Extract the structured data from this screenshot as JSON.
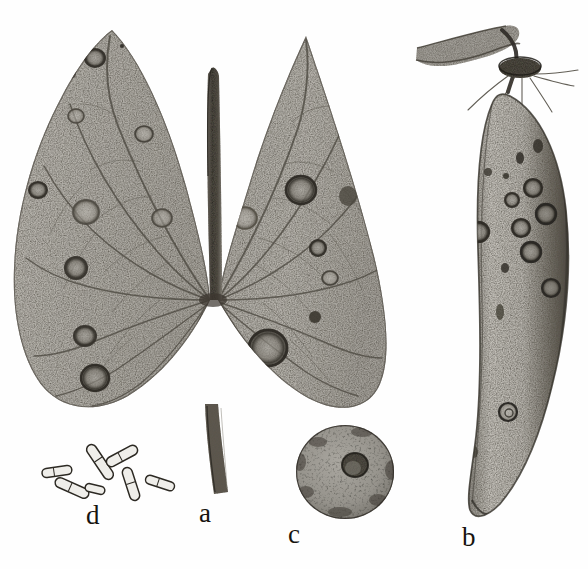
{
  "plate": {
    "background_color": "#fefefe",
    "ink_color": "#16140f",
    "medium": "stippled pen-and-ink scientific illustration",
    "subject": "anthracnose disease symptoms on leaf, pod and seed with conidia",
    "width": 588,
    "height": 569
  },
  "labels": [
    {
      "id": "a",
      "text": "a",
      "x": 199,
      "y": 500,
      "refers_to": "diseased leaf with petiole"
    },
    {
      "id": "b",
      "text": "b",
      "x": 462,
      "y": 524,
      "refers_to": "diseased pod with peduncle"
    },
    {
      "id": "c",
      "text": "c",
      "x": 288,
      "y": 521,
      "refers_to": "infected seed showing hilum"
    },
    {
      "id": "d",
      "text": "d",
      "x": 86,
      "y": 502,
      "refers_to": "conidia / spores"
    }
  ],
  "figures": {
    "leaf": {
      "name": "a",
      "description": "Bilobed arrowhead leaf, stippled grey lamina, dark midrib running vertically through the sinus, radiating palmate veins from the basal node, petiole descending below",
      "bounds": {
        "x": 8,
        "y": 28,
        "width": 378,
        "height": 470
      },
      "tone": "#b3b0aa",
      "lesion_count": 21,
      "lesions": [
        {
          "cx": 95,
          "cy": 58,
          "rx": 11,
          "ry": 10,
          "tone": "dark-ring"
        },
        {
          "cx": 70,
          "cy": 74,
          "rx": 6,
          "ry": 5,
          "tone": "dark-spot"
        },
        {
          "cx": 122,
          "cy": 46,
          "rx": 2,
          "ry": 2,
          "tone": "fleck"
        },
        {
          "cx": 76,
          "cy": 116,
          "rx": 9,
          "ry": 8,
          "tone": "pale-ring"
        },
        {
          "cx": 144,
          "cy": 134,
          "rx": 10,
          "ry": 9,
          "tone": "pale-ring"
        },
        {
          "cx": 38,
          "cy": 190,
          "rx": 10,
          "ry": 9,
          "tone": "dark-ring"
        },
        {
          "cx": 86,
          "cy": 212,
          "rx": 14,
          "ry": 13,
          "tone": "pale-ring"
        },
        {
          "cx": 76,
          "cy": 268,
          "rx": 12,
          "ry": 12,
          "tone": "dark-ring"
        },
        {
          "cx": 85,
          "cy": 336,
          "rx": 12,
          "ry": 11,
          "tone": "dark-ring"
        },
        {
          "cx": 95,
          "cy": 378,
          "rx": 15,
          "ry": 14,
          "tone": "dark-ring"
        },
        {
          "cx": 162,
          "cy": 218,
          "rx": 11,
          "ry": 10,
          "tone": "pale-ring"
        },
        {
          "cx": 182,
          "cy": 156,
          "rx": 3,
          "ry": 3,
          "tone": "fleck"
        },
        {
          "cx": 243,
          "cy": 126,
          "rx": 11,
          "ry": 10,
          "tone": "dark-ring"
        },
        {
          "cx": 245,
          "cy": 218,
          "rx": 13,
          "ry": 12,
          "tone": "dark-ring"
        },
        {
          "cx": 301,
          "cy": 190,
          "rx": 16,
          "ry": 15,
          "tone": "dark-ring"
        },
        {
          "cx": 318,
          "cy": 248,
          "rx": 9,
          "ry": 9,
          "tone": "dark-ring"
        },
        {
          "cx": 348,
          "cy": 196,
          "rx": 9,
          "ry": 10,
          "tone": "dark-spot"
        },
        {
          "cx": 330,
          "cy": 278,
          "rx": 9,
          "ry": 8,
          "tone": "pale-ring"
        },
        {
          "cx": 315,
          "cy": 317,
          "rx": 6,
          "ry": 6,
          "tone": "dark-spot"
        },
        {
          "cx": 268,
          "cy": 348,
          "rx": 20,
          "ry": 19,
          "tone": "dark-ring"
        },
        {
          "cx": 226,
          "cy": 110,
          "rx": 8,
          "ry": 7,
          "tone": "pale-ring"
        }
      ],
      "midrib": {
        "top_y": 72,
        "bottom_y": 300,
        "x": 212,
        "color": "#4a463f"
      },
      "petiole": {
        "top_y": 405,
        "bottom_y": 495,
        "x": 215,
        "color": "#5a554c"
      }
    },
    "pod": {
      "name": "b",
      "description": "Elongate curved legume pod, stippled, bearing sunken circular anthracnose lesions; peduncle at top curving from upper left into a dark calyx collar with dried sepal threads",
      "bounds": {
        "x": 410,
        "y": 24,
        "width": 170,
        "height": 500
      },
      "tone": "#b8b5ae",
      "lesion_count": 16,
      "lesions": [
        {
          "cx": 520,
          "cy": 158,
          "rx": 4,
          "ry": 6,
          "tone": "dark-spot"
        },
        {
          "cx": 506,
          "cy": 176,
          "rx": 3,
          "ry": 3,
          "tone": "fleck"
        },
        {
          "cx": 538,
          "cy": 146,
          "rx": 5,
          "ry": 7,
          "tone": "dark-spot"
        },
        {
          "cx": 488,
          "cy": 172,
          "rx": 4,
          "ry": 4,
          "tone": "fleck"
        },
        {
          "cx": 533,
          "cy": 188,
          "rx": 10,
          "ry": 10,
          "tone": "dark-ring"
        },
        {
          "cx": 512,
          "cy": 200,
          "rx": 8,
          "ry": 8,
          "tone": "dark-ring"
        },
        {
          "cx": 546,
          "cy": 214,
          "rx": 11,
          "ry": 11,
          "tone": "dark-ring"
        },
        {
          "cx": 521,
          "cy": 228,
          "rx": 10,
          "ry": 10,
          "tone": "dark-ring"
        },
        {
          "cx": 478,
          "cy": 232,
          "rx": 12,
          "ry": 11,
          "tone": "dark-ring"
        },
        {
          "cx": 531,
          "cy": 252,
          "rx": 11,
          "ry": 11,
          "tone": "dark-ring"
        },
        {
          "cx": 505,
          "cy": 268,
          "rx": 4,
          "ry": 5,
          "tone": "fleck"
        },
        {
          "cx": 551,
          "cy": 288,
          "rx": 10,
          "ry": 10,
          "tone": "dark-ring"
        },
        {
          "cx": 470,
          "cy": 340,
          "rx": 6,
          "ry": 16,
          "tone": "elongate-ring"
        },
        {
          "cx": 500,
          "cy": 312,
          "rx": 4,
          "ry": 8,
          "tone": "dark-spot"
        },
        {
          "cx": 508,
          "cy": 412,
          "rx": 10,
          "ry": 10,
          "tone": "dark-ring"
        },
        {
          "cx": 474,
          "cy": 452,
          "rx": 4,
          "ry": 6,
          "tone": "fleck"
        }
      ],
      "peduncle": {
        "from_x": 420,
        "from_y": 44,
        "to_x": 518,
        "to_y": 62
      },
      "calyx": {
        "cx": 520,
        "cy": 66,
        "rx": 20,
        "ry": 9,
        "color": "#3a362f"
      }
    },
    "seed": {
      "name": "c",
      "description": "Rounded coarsely-mottled seed, dark sunken hilum right of centre",
      "bounds": {
        "x": 296,
        "y": 424,
        "width": 99,
        "height": 96
      },
      "cx": 345,
      "cy": 472,
      "rx": 49,
      "ry": 47,
      "tone": "#9b9892",
      "hilum": {
        "cx": 355,
        "cy": 465,
        "rx": 13,
        "ry": 12,
        "color": "#3b3831"
      }
    },
    "conidia": {
      "name": "d",
      "description": "Seven hyaline cylindrical slightly-curved conidia with rounded ends, drawn in fine outline",
      "bounds": {
        "x": 36,
        "y": 444,
        "width": 145,
        "height": 56
      },
      "count": 7,
      "spores": [
        {
          "cx": 57,
          "cy": 472,
          "len": 30,
          "thick": 9,
          "angle": -8
        },
        {
          "cx": 72,
          "cy": 488,
          "len": 36,
          "thick": 10,
          "angle": 24
        },
        {
          "cx": 100,
          "cy": 462,
          "len": 40,
          "thick": 10,
          "angle": 56
        },
        {
          "cx": 122,
          "cy": 456,
          "len": 34,
          "thick": 10,
          "angle": -28
        },
        {
          "cx": 131,
          "cy": 484,
          "len": 34,
          "thick": 10,
          "angle": 72
        },
        {
          "cx": 95,
          "cy": 489,
          "len": 20,
          "thick": 8,
          "angle": 14
        },
        {
          "cx": 160,
          "cy": 483,
          "len": 30,
          "thick": 9,
          "angle": 18
        }
      ]
    }
  }
}
